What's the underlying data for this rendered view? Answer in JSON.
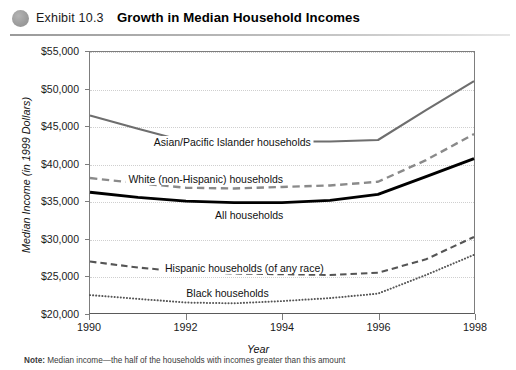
{
  "header": {
    "exhibit_label": "Exhibit 10.3",
    "title": "Growth in Median Household Incomes",
    "bullet_icon": "filled-circle-icon"
  },
  "footnote": {
    "prefix": "Note:",
    "text": "Median income—the half of the households with incomes greater than this amount"
  },
  "chart_data": {
    "type": "line",
    "title": "Growth in Median Household Incomes",
    "xlabel": "Year",
    "ylabel": "Median Income (in 1999 Dollars)",
    "x": [
      1990,
      1991,
      1992,
      1993,
      1994,
      1995,
      1996,
      1997,
      1998
    ],
    "xticks": [
      "1990",
      "1992",
      "1994",
      "1996",
      "1998"
    ],
    "xtick_values": [
      1990,
      1992,
      1994,
      1996,
      1998
    ],
    "yticks": [
      "$20,000",
      "$25,000",
      "$30,000",
      "$35,000",
      "$40,000",
      "$45,000",
      "$50,000",
      "$55,000"
    ],
    "ytick_values": [
      20000,
      25000,
      30000,
      35000,
      40000,
      45000,
      50000,
      55000
    ],
    "xlim": [
      1990,
      1998
    ],
    "ylim": [
      20000,
      55000
    ],
    "grid": "horizontal-dotted",
    "legend": "inline-labels",
    "series": [
      {
        "name": "Asian/Pacific Islander households",
        "style": "solid",
        "color": "#6e6e6e",
        "width": 2.1,
        "values": [
          46500,
          44700,
          43000,
          43000,
          43000,
          43000,
          43200,
          47200,
          51100
        ],
        "label_x": 1992.95,
        "label_y": 43000
      },
      {
        "name": "White (non-Hispanic) households",
        "style": "dashed",
        "color": "#8a8a8a",
        "width": 2.4,
        "values": [
          38100,
          37400,
          36800,
          36700,
          36900,
          37100,
          37600,
          40500,
          44000
        ],
        "label_x": 1992.4,
        "label_y": 38100
      },
      {
        "name": "All households",
        "style": "solid",
        "color": "#000000",
        "width": 2.9,
        "values": [
          36200,
          35500,
          35000,
          34800,
          34800,
          35100,
          35900,
          38300,
          40700
        ],
        "label_x": 1993.3,
        "label_y": 33300
      },
      {
        "name": "Hispanic households (of any race)",
        "style": "dashed",
        "color": "#555555",
        "width": 2.1,
        "values": [
          26900,
          26100,
          25500,
          25300,
          25200,
          25100,
          25400,
          27200,
          30200
        ],
        "label_x": 1993.2,
        "label_y": 26300
      },
      {
        "name": "Black households",
        "style": "dotted",
        "color": "#555555",
        "width": 2.0,
        "values": [
          22400,
          21900,
          21400,
          21300,
          21600,
          22000,
          22600,
          25100,
          27800
        ],
        "label_x": 1992.85,
        "label_y": 22900
      }
    ]
  }
}
